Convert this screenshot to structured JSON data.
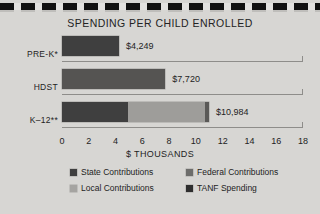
{
  "chart_data": {
    "type": "bar",
    "orientation": "horizontal",
    "stacked": true,
    "title": "SPENDING PER CHILD ENROLLED",
    "xlabel": "$ THOUSANDS",
    "ylabel": "",
    "xlim": [
      0,
      18
    ],
    "xticks": [
      0,
      2,
      4,
      6,
      8,
      10,
      12,
      14,
      16,
      18
    ],
    "xtick_labels": [
      "0",
      "2",
      "4",
      "6",
      "8",
      "10",
      "12",
      "14",
      "16",
      "18"
    ],
    "grid": false,
    "legend_position": "bottom",
    "categories": [
      "PRE-K*",
      "HDST",
      "K–12**"
    ],
    "series": [
      {
        "name": "State Contributions",
        "color": "#3f3f3f",
        "values": [
          4.249,
          0,
          4.9
        ]
      },
      {
        "name": "Federal Contributions",
        "color": "#6d6d6b",
        "values": [
          0,
          7.72,
          0.35
        ]
      },
      {
        "name": "Local Contributions",
        "color": "#a5a4a1",
        "values": [
          0,
          0,
          5.4
        ]
      },
      {
        "name": "TANF Spending",
        "color": "#2e2e2e",
        "values": [
          0,
          0,
          0.334
        ]
      }
    ],
    "bars": [
      {
        "category": "PRE-K*",
        "total": 4.249,
        "value_label": "$4,249",
        "segments": [
          {
            "series": "State Contributions",
            "value": 4.249,
            "color": "#3f3f3f"
          }
        ]
      },
      {
        "category": "HDST",
        "total": 7.72,
        "value_label": "$7,720",
        "segments": [
          {
            "series": "Federal Contributions",
            "value": 7.72,
            "color": "#555452"
          }
        ]
      },
      {
        "category": "K–12**",
        "total": 10.984,
        "value_label": "$10,984",
        "segments": [
          {
            "series": "State Contributions",
            "value": 4.9,
            "color": "#3f3f3f"
          },
          {
            "series": "Local Contributions",
            "value": 5.75,
            "color": "#9e9d9a"
          },
          {
            "series": "TANF Spending",
            "value": 0.334,
            "color": "#5a5957"
          }
        ]
      }
    ],
    "legend": [
      {
        "label": "State Contributions",
        "color": "#3f3f3f"
      },
      {
        "label": "Federal Contributions",
        "color": "#6d6d6b"
      },
      {
        "label": "Local Contributions",
        "color": "#a5a4a1"
      },
      {
        "label": "TANF Spending",
        "color": "#2e2e2e"
      }
    ]
  },
  "colors": {
    "background": "#d7d6d3",
    "text": "#232323",
    "axis": "#8e8d8a",
    "rule_dash": "#111111"
  }
}
